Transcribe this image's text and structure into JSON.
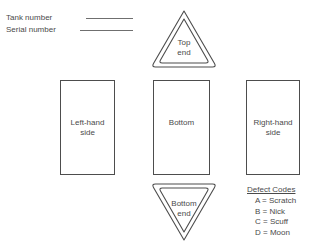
{
  "diagram": {
    "identifiers": [
      {
        "label": "Tank number",
        "leader": "blank-line"
      },
      {
        "label": "Serial number",
        "leader": "blank-line"
      }
    ],
    "panels": [
      {
        "name": "left-hand-side",
        "line1": "Left-hand",
        "line2": "side"
      },
      {
        "name": "bottom",
        "line1": "Bottom",
        "line2": ""
      },
      {
        "name": "right-hand-side",
        "line1": "Right-hand",
        "line2": "side"
      }
    ],
    "ends": [
      {
        "name": "top-end",
        "line1": "Top",
        "line2": "end",
        "orientation": "point-up"
      },
      {
        "name": "bottom-end",
        "line1": "Bottom",
        "line2": "end",
        "orientation": "point-down"
      }
    ],
    "legend": {
      "title": "Defect Codes",
      "codes": [
        {
          "code": "A",
          "equals": "=",
          "meaning": "Scratch",
          "text": "A = Scratch"
        },
        {
          "code": "B",
          "equals": "=",
          "meaning": "Nick",
          "text": "B = Nick"
        },
        {
          "code": "C",
          "equals": "=",
          "meaning": "Scuff",
          "text": "C = Scuff"
        },
        {
          "code": "D",
          "equals": "=",
          "meaning": "Moon",
          "text": "D = Moon"
        }
      ]
    },
    "colors": {
      "background": "#ffffff",
      "stroke": "#4d4d4d",
      "text": "#4a4a4a",
      "leader_line": "#6f6f6f"
    }
  }
}
